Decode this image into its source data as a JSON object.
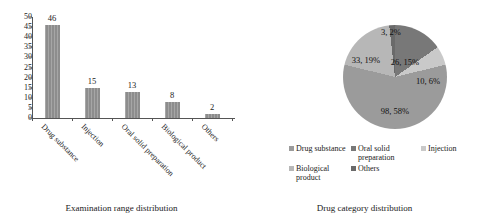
{
  "chart_data": [
    {
      "type": "bar",
      "title": "",
      "caption": "Examination range distribution",
      "categories": [
        "Drug substance",
        "Injection",
        "Oral solid preparation",
        "Biological product",
        "Others"
      ],
      "values": [
        46,
        15,
        13,
        8,
        2
      ],
      "value_labels": [
        "46",
        "15",
        "13",
        "8",
        "2"
      ],
      "xlabel": "",
      "ylabel": "",
      "ylim": [
        0,
        50
      ],
      "yticks": [
        "0",
        "5",
        "10",
        "15",
        "20",
        "25",
        "30",
        "35",
        "40",
        "45",
        "50"
      ],
      "grid": false,
      "bar_color": "#8d8d8d"
    },
    {
      "type": "pie",
      "title": "",
      "caption": "Drug category distribution",
      "labels": [
        "Drug substance",
        "Oral solid preparation",
        "Injection",
        "Biological product",
        "Others"
      ],
      "values": [
        98,
        26,
        10,
        33,
        3
      ],
      "percents": [
        "58%",
        "15%",
        "6%",
        "19%",
        "2%"
      ],
      "slice_labels": [
        "98, 58%",
        "26, 15%",
        "10, 6%",
        "33, 19%",
        "3, 2%"
      ],
      "colors": [
        "#9b9b9b",
        "#787878",
        "#c9c9c9",
        "#b7b7b7",
        "#6a6a6a"
      ],
      "legend_position": "bottom"
    }
  ],
  "bar_chart": {
    "caption": "Examination range distribution",
    "yticks": [
      "50",
      "45",
      "40",
      "35",
      "30",
      "25",
      "20",
      "15",
      "10",
      "5",
      "0"
    ],
    "bars": [
      {
        "label": "Drug substance",
        "value": 46,
        "value_label": "46"
      },
      {
        "label": "Injection",
        "value": 15,
        "value_label": "15"
      },
      {
        "label": "Oral solid preparation",
        "value": 13,
        "value_label": "13"
      },
      {
        "label": "Biological product",
        "value": 8,
        "value_label": "8"
      },
      {
        "label": "Others",
        "value": 2,
        "value_label": "2"
      }
    ]
  },
  "pie_chart": {
    "caption": "Drug category distribution",
    "slices": [
      {
        "label": "Drug substance",
        "value": 98,
        "percent": "58%",
        "slice_label": "98, 58%",
        "color": "#9b9b9b"
      },
      {
        "label": "Oral solid preparation",
        "value": 26,
        "percent": "15%",
        "slice_label": "26, 15%",
        "color": "#787878"
      },
      {
        "label": "Injection",
        "value": 10,
        "percent": "6%",
        "slice_label": "10, 6%",
        "color": "#c9c9c9"
      },
      {
        "label": "Biological product",
        "value": 33,
        "percent": "19%",
        "slice_label": "33, 19%",
        "color": "#b7b7b7"
      },
      {
        "label": "Others",
        "value": 3,
        "percent": "2%",
        "slice_label": "3, 2%",
        "color": "#6a6a6a"
      }
    ],
    "legend": [
      {
        "label": "Drug substance",
        "color": "#9b9b9b"
      },
      {
        "label": "Oral solid preparation",
        "color": "#787878"
      },
      {
        "label": "Injection",
        "color": "#c9c9c9"
      },
      {
        "label": "Biological product",
        "color": "#b7b7b7"
      },
      {
        "label": "Others",
        "color": "#6a6a6a"
      }
    ]
  }
}
